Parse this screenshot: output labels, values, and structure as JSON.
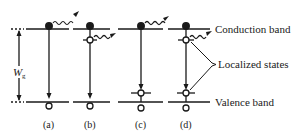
{
  "figure": {
    "band_labels": {
      "conduction": "Conduction band",
      "localized": "Localized states",
      "valence": "Valence band"
    },
    "gap_label": "W",
    "gap_subscript": "g",
    "panels": [
      {
        "id": "a",
        "label": "(a)",
        "description": "band-to-band recombination with photon emission"
      },
      {
        "id": "b",
        "label": "(b)",
        "description": "electron captured by localized state below conduction band, photon emitted"
      },
      {
        "id": "c",
        "label": "(c)",
        "description": "electron falls to localized state above valence band, photon emitted at top"
      },
      {
        "id": "d",
        "label": "(d)",
        "description": "transition via two localized states"
      }
    ],
    "colors": {
      "ink": "#1a1a1a",
      "background": "#ffffff"
    }
  }
}
